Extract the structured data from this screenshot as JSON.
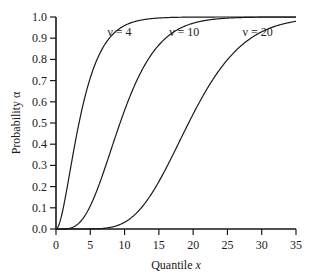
{
  "chart_data": {
    "type": "line",
    "title": "",
    "xlabel": "Quantile x",
    "xlabel_main": "Quantile ",
    "xlabel_var": "x",
    "ylabel": "Probability α",
    "xlim": [
      0,
      35
    ],
    "ylim": [
      0.0,
      1.0
    ],
    "grid": false,
    "legend": "inline curve labels",
    "x_ticks": [
      0,
      5,
      10,
      15,
      20,
      25,
      30,
      35
    ],
    "x_tick_labels": [
      "0",
      "5",
      "10",
      "15",
      "20",
      "25",
      "30",
      "35"
    ],
    "y_ticks": [
      0.0,
      0.1,
      0.2,
      0.3,
      0.4,
      0.5,
      0.6,
      0.7,
      0.8,
      0.9,
      1.0
    ],
    "y_tick_labels": [
      "0.0",
      "0.1",
      "0.2",
      "0.3",
      "0.4",
      "0.5",
      "0.6",
      "0.7",
      "0.8",
      "0.9",
      "1.0"
    ],
    "distribution": "chi-square CDF",
    "series": [
      {
        "name": "ν = 4",
        "dof": 4,
        "label_pos": [
          7.5,
          0.93
        ],
        "x": [
          0,
          1,
          2,
          3,
          4,
          5,
          6,
          8,
          10,
          12,
          15,
          20,
          35
        ],
        "values": [
          0.0,
          0.09,
          0.26,
          0.44,
          0.59,
          0.71,
          0.8,
          0.91,
          0.96,
          0.98,
          0.995,
          1.0,
          1.0
        ]
      },
      {
        "name": "ν = 10",
        "dof": 10,
        "label_pos": [
          16.5,
          0.93
        ],
        "x": [
          0,
          2,
          4,
          6,
          8,
          10,
          12,
          14,
          16,
          18,
          20,
          25,
          30,
          35
        ],
        "values": [
          0.0,
          0.004,
          0.05,
          0.18,
          0.37,
          0.56,
          0.71,
          0.83,
          0.9,
          0.95,
          0.97,
          0.995,
          0.999,
          1.0
        ]
      },
      {
        "name": "ν = 20",
        "dof": 20,
        "label_pos": [
          27.2,
          0.93
        ],
        "x": [
          0,
          5,
          8,
          10,
          12,
          14,
          16,
          18,
          20,
          22,
          24,
          26,
          28,
          30,
          32,
          35
        ],
        "values": [
          0.0,
          0.0002,
          0.008,
          0.03,
          0.08,
          0.17,
          0.28,
          0.41,
          0.54,
          0.66,
          0.75,
          0.83,
          0.89,
          0.93,
          0.96,
          0.98
        ]
      }
    ]
  }
}
